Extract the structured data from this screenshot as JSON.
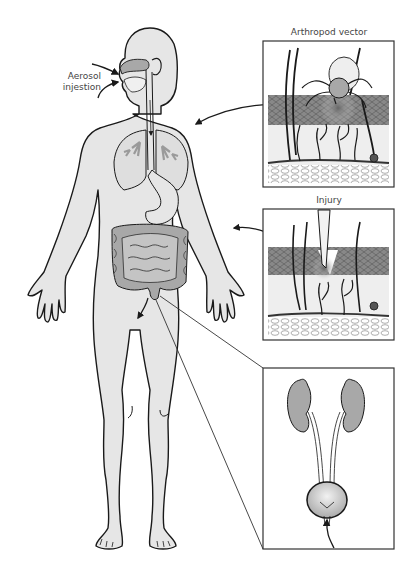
{
  "labels": {
    "aerosol": [
      "Aerosol",
      "injestion"
    ],
    "arthropod": "Arthropod vector",
    "injury": "Injury"
  },
  "panels": [
    {
      "id": "arthropod-vector",
      "title": "Arthropod vector",
      "content": "skin cross-section with tick feeding"
    },
    {
      "id": "injury",
      "title": "Injury",
      "content": "skin cross-section with penetrating blade"
    },
    {
      "id": "urinary-tract",
      "title": "",
      "content": "kidneys, ureters and bladder with ascending arrow"
    }
  ],
  "colors": {
    "body_fill": "#e6e6e6",
    "outline": "#1a1a1a",
    "organ_fill": "#a8a8a8",
    "lung_fill": "#dcdcdc",
    "label_text": "#444444",
    "box_border": "#333333"
  }
}
